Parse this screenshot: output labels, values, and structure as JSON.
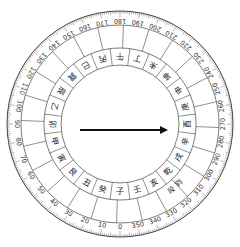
{
  "compass": {
    "center": [
      120,
      124
    ],
    "radii": {
      "outer": 113,
      "tick_inner": 107,
      "degree_inner": 99,
      "middle": 76,
      "inner": 59
    },
    "orientation": "0 at bottom, increasing clockwise (90 left, 180 top, 270 right)",
    "degree_labels": [
      0,
      10,
      20,
      30,
      40,
      50,
      60,
      70,
      80,
      90,
      100,
      110,
      120,
      130,
      140,
      150,
      160,
      170,
      180,
      190,
      200,
      210,
      220,
      230,
      240,
      250,
      260,
      270,
      280,
      290,
      300,
      310,
      320,
      330,
      340,
      350
    ],
    "mountains": [
      "子",
      "癸",
      "丑",
      "艮",
      "寅",
      "甲",
      "卯",
      "乙",
      "辰",
      "巽",
      "巳",
      "丙",
      "午",
      "丁",
      "未",
      "坤",
      "申",
      "庚",
      "酉",
      "辛",
      "戌",
      "乾",
      "亥",
      "壬"
    ],
    "extra_marks": [
      {
        "angle": 315,
        "text": "鈞"
      },
      {
        "angle": 322,
        "text": "段"
      }
    ],
    "line_color": "#444444",
    "arrow": {
      "from": [
        80,
        130
      ],
      "to": [
        168,
        130
      ],
      "color": "#111111",
      "direction_label": "pointing to 酉 (270°)"
    }
  }
}
